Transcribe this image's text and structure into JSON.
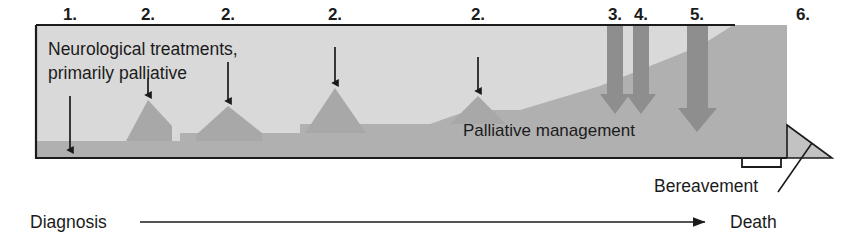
{
  "figure": {
    "title_inside_box": {
      "line1": "Neurological treatments,",
      "line2": "primarily palliative"
    },
    "band_label": "Palliative management",
    "bereavement_label": "Bereavement",
    "axis": {
      "start_label": "Diagnosis",
      "end_label": "Death"
    },
    "markers": [
      {
        "id": "m1",
        "label": "1.",
        "x": 70,
        "arrow_x": 70,
        "arrow_top": 62,
        "arrow_bottom": 156,
        "style": "thin"
      },
      {
        "id": "m2a",
        "label": "2.",
        "x": 148,
        "arrow_x": 148,
        "arrow_top": 78,
        "arrow_bottom": 104,
        "style": "thin"
      },
      {
        "id": "m2b",
        "label": "2.",
        "x": 228,
        "arrow_x": 228,
        "arrow_top": 62,
        "arrow_bottom": 110,
        "style": "thin"
      },
      {
        "id": "m2c",
        "label": "2.",
        "x": 335,
        "arrow_x": 335,
        "arrow_top": 48,
        "arrow_bottom": 92,
        "style": "thin"
      },
      {
        "id": "m2d",
        "label": "2.",
        "x": 478,
        "arrow_x": 478,
        "arrow_top": 56,
        "arrow_bottom": 100,
        "style": "thin"
      },
      {
        "id": "m3",
        "label": "3.",
        "x": 615,
        "arrow_x": 615,
        "arrow_top": 33,
        "arrow_bottom": 112,
        "style": "block"
      },
      {
        "id": "m4",
        "label": "4.",
        "x": 641,
        "arrow_x": 641,
        "arrow_top": 33,
        "arrow_bottom": 112,
        "style": "block"
      },
      {
        "id": "m5",
        "label": "5.",
        "x": 697,
        "arrow_x": 697,
        "arrow_top": 33,
        "arrow_bottom": 130,
        "style": "block"
      },
      {
        "id": "m6",
        "label": "6.",
        "x": 803,
        "arrow_x": null,
        "arrow_top": null,
        "arrow_bottom": null,
        "style": "none"
      }
    ],
    "colors": {
      "stroke": "#1b1b1b",
      "box_fill": "#d9d9d9",
      "band_fill": "#a8a8a8",
      "ramp_fill": "#b0b0b0",
      "block_arrow_fill": "#8e8e8e",
      "bereavement_fill": "#c2c2c2",
      "background": "#ffffff"
    },
    "geometry": {
      "box_left": 36,
      "box_top": 25,
      "box_right": 787,
      "box_bottom": 158,
      "top_line_right": 735
    }
  }
}
